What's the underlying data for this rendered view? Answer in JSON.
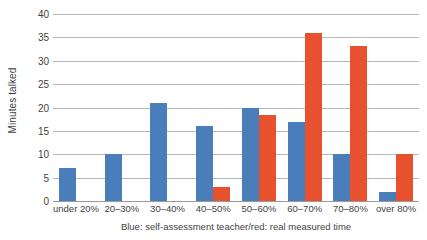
{
  "chart_data": {
    "type": "bar",
    "title": "",
    "xlabel": "Blue: self-assessment teacher/red: real measured time",
    "ylabel": "Minutes talked",
    "ylim": [
      0,
      40
    ],
    "yticks": [
      0,
      5,
      10,
      15,
      20,
      25,
      30,
      35,
      40
    ],
    "grid": true,
    "legend_position": "none",
    "categories": [
      "under 20%",
      "20–30%",
      "30–40%",
      "40–50%",
      "50–60%",
      "60–70%",
      "70–80%",
      "over 80%"
    ],
    "series": [
      {
        "name": "Blue: self-assessment teacher",
        "color": "#4a7ebb",
        "values": [
          7,
          10,
          21,
          16,
          20,
          17,
          10,
          2
        ]
      },
      {
        "name": "red: real measured time",
        "color": "#e8512d",
        "values": [
          0,
          0,
          0,
          3,
          18.3,
          36,
          33.2,
          10
        ]
      }
    ]
  },
  "colors": {
    "blue": "#4a7ebb",
    "red": "#e8512d",
    "gridline": "#b7b7b7",
    "axis": "#9a9a9a",
    "text": "#3f3f3f",
    "background": "#ffffff"
  }
}
